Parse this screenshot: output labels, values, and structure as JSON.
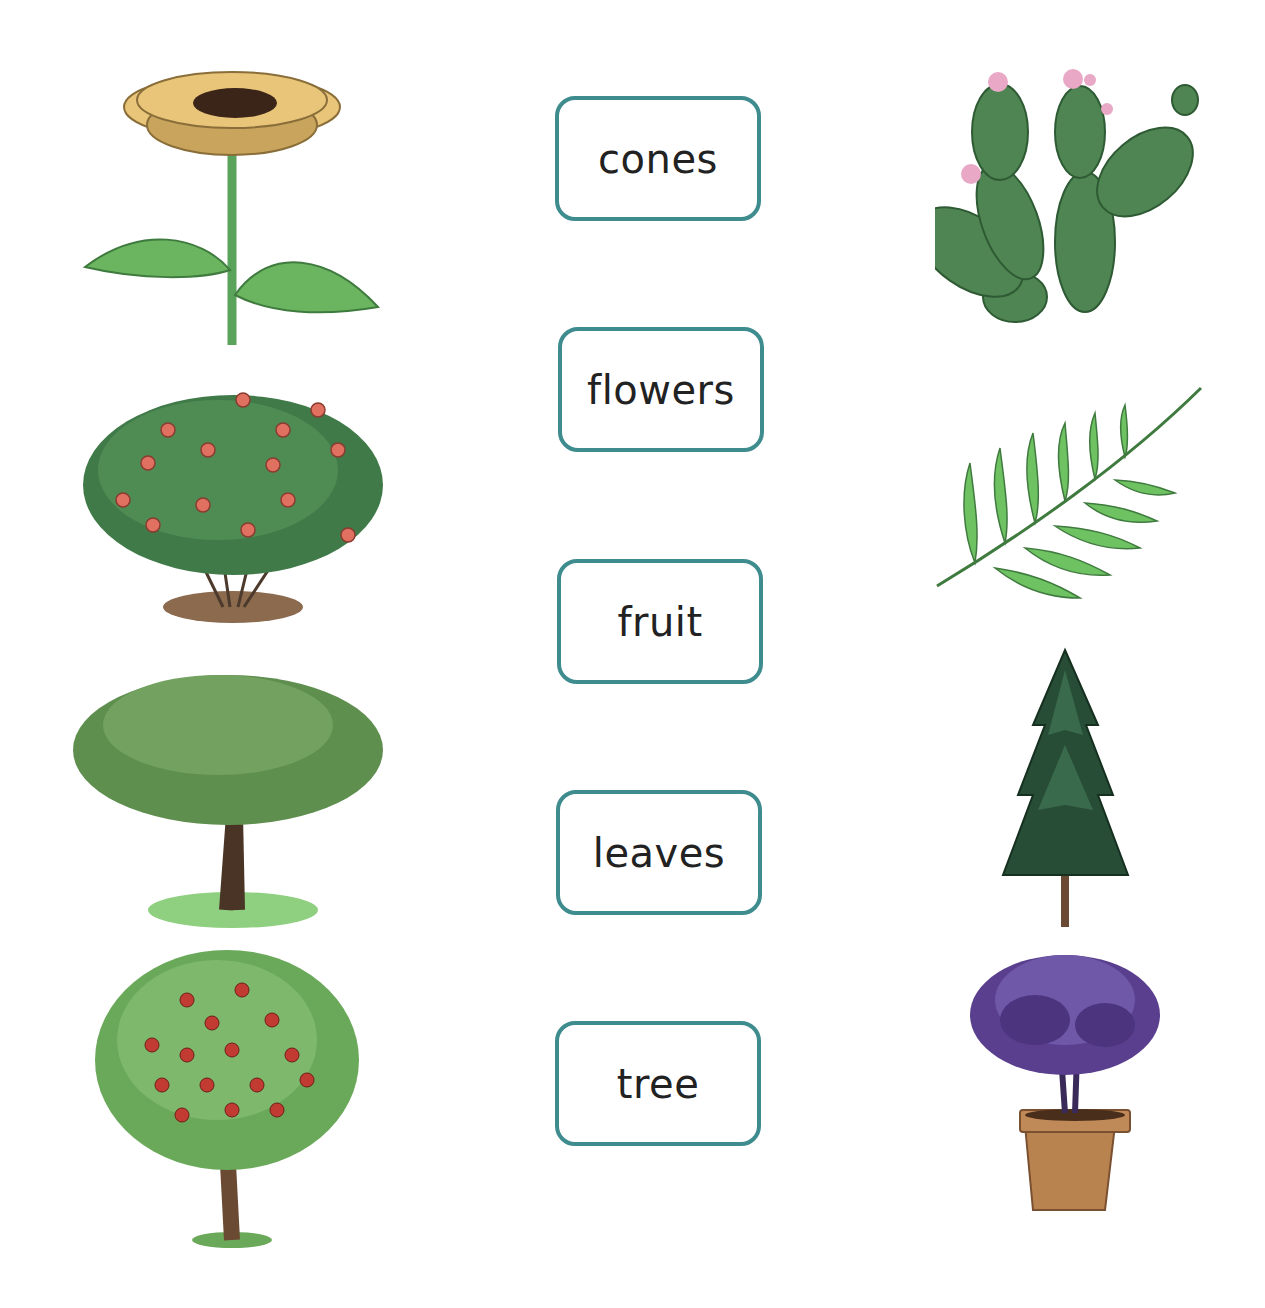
{
  "worksheet": {
    "words": [
      {
        "label": "cones"
      },
      {
        "label": "flowers"
      },
      {
        "label": "fruit"
      },
      {
        "label": "leaves"
      },
      {
        "label": "tree"
      }
    ],
    "left_images": [
      {
        "name": "sunflower"
      },
      {
        "name": "rose-bush"
      },
      {
        "name": "leafy-tree"
      },
      {
        "name": "apple-tree"
      }
    ],
    "right_images": [
      {
        "name": "prickly-pear-cactus"
      },
      {
        "name": "fern-frond"
      },
      {
        "name": "pine-conifer"
      },
      {
        "name": "potted-purple-plant"
      }
    ],
    "colors": {
      "box_border": "#3f8c8f",
      "text": "#222222",
      "leaf_green": "#6aa85a",
      "dark_green": "#3d6b45",
      "petal": "#e9c46a"
    }
  }
}
